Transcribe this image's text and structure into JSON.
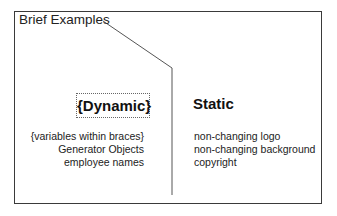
{
  "diagram": {
    "title": "Brief Examples",
    "dynamic": {
      "heading": "{Dynamic}",
      "items": [
        "{variables within braces}",
        "Generator Objects",
        "employee names"
      ]
    },
    "static": {
      "heading": "Static",
      "items": [
        "non-changing logo",
        "non-changing background",
        "copyright"
      ]
    }
  }
}
